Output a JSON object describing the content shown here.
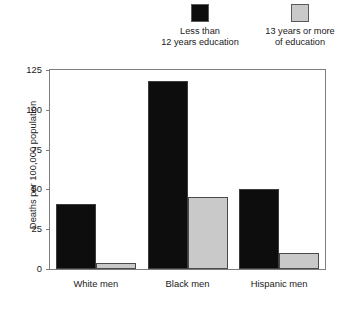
{
  "chart_data": {
    "type": "bar",
    "title": "",
    "xlabel": "",
    "ylabel": "Deaths per 100,000 population",
    "categories": [
      "White men",
      "Black men",
      "Hispanic men"
    ],
    "series": [
      {
        "name": "Less than 12 years education",
        "color": "#0d0d0d",
        "values": [
          41,
          118,
          50
        ]
      },
      {
        "name": "13 years or more of education",
        "color": "#c9c9c9",
        "values": [
          4,
          45,
          10
        ]
      }
    ],
    "ylim": [
      0,
      125
    ],
    "yticks": [
      0,
      25,
      50,
      75,
      100,
      125
    ],
    "ytick_labels": [
      "0",
      "25",
      "50",
      "75",
      "100",
      "125"
    ],
    "grid": false,
    "legend_position": "top"
  },
  "legend": {
    "entries": [
      {
        "swatch": "dark-swatch",
        "line1": "Less than",
        "line2": "12 years education"
      },
      {
        "swatch": "light-swatch",
        "line1": "13 years or more",
        "line2": "of education"
      }
    ]
  }
}
